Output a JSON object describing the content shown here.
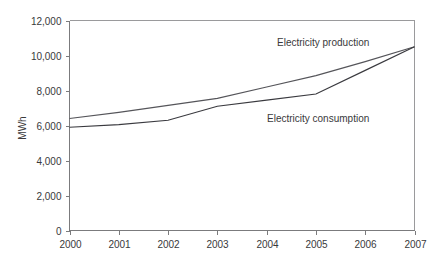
{
  "chart_data": {
    "type": "line",
    "title": "",
    "subtitle": "",
    "xlabel": "",
    "ylabel": "MWh",
    "categories": [
      "2000",
      "2001",
      "2002",
      "2003",
      "2004",
      "2005",
      "2006",
      "2007"
    ],
    "x": [
      2000,
      2001,
      2002,
      2003,
      2004,
      2005,
      2006,
      2007
    ],
    "xlim": [
      2000,
      2007
    ],
    "ylim": [
      0,
      12000
    ],
    "y_ticks": [
      0,
      2000,
      4000,
      6000,
      8000,
      10000,
      12000
    ],
    "y_tick_labels": [
      "0",
      "2,000",
      "4,000",
      "6,000",
      "8,000",
      "10,000",
      "12,000"
    ],
    "x_ticks": [
      2000,
      2001,
      2002,
      2003,
      2004,
      2005,
      2006,
      2007
    ],
    "x_tick_labels": [
      "2000",
      "2001",
      "2002",
      "2003",
      "2004",
      "2005",
      "2006",
      "2007"
    ],
    "grid": false,
    "legend": "inline-annotations",
    "series": [
      {
        "name": "Electricity production",
        "color": "#55555a",
        "values": [
          6400,
          6750,
          7150,
          7550,
          8200,
          8850,
          9650,
          10500
        ]
      },
      {
        "name": "Electricity consumption",
        "color": "#3a3a3f",
        "values": [
          5900,
          6050,
          6300,
          7100,
          7450,
          7800,
          9150,
          10500
        ]
      }
    ],
    "annotations": [
      {
        "text": "Electricity production",
        "x_px": 277,
        "y_px": 46,
        "series": "Electricity production"
      },
      {
        "text": "Electricity consumption",
        "x_px": 267,
        "y_px": 122,
        "series": "Electricity consumption"
      }
    ]
  },
  "axis": {
    "y_axis_title": "MWh"
  },
  "colors": {
    "production_line": "#55555a",
    "consumption_line": "#3a3a3f",
    "axis": "#7b7b7d",
    "frame": "#9a9a9c",
    "text": "#39393b",
    "background": "#ffffff"
  }
}
